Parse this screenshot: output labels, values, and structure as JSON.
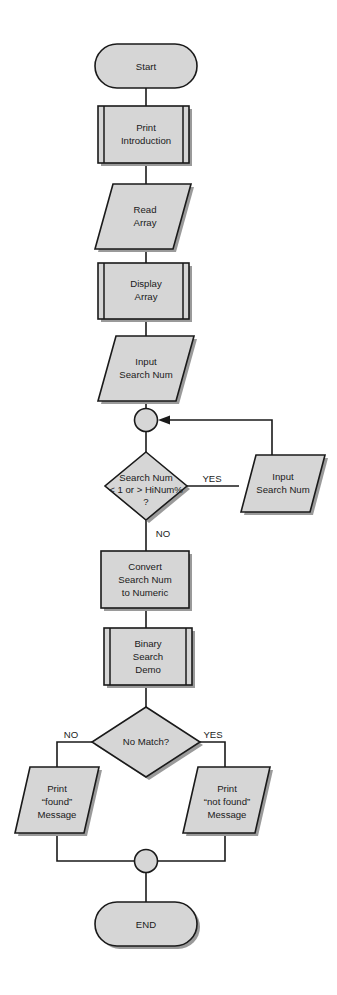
{
  "diagram": {
    "type": "flowchart",
    "background_color": "#ffffff",
    "node_fill_color": "#d6d6d6",
    "node_stroke_color": "#1a1a1a",
    "shadow_color": "#9a9a9a",
    "nodes": {
      "start": {
        "label": "Start",
        "shape": "terminator"
      },
      "print_intro": {
        "line1": "Print",
        "line2": "Introduction",
        "shape": "predefined-process"
      },
      "read_array": {
        "line1": "Read",
        "line2": "Array",
        "shape": "parallelogram"
      },
      "display_array": {
        "line1": "Display",
        "line2": "Array",
        "shape": "predefined-process"
      },
      "input_search_num": {
        "line1": "Input",
        "line2": "Search Num",
        "shape": "parallelogram"
      },
      "connector_top": {
        "label": "",
        "shape": "connector"
      },
      "validate_decision": {
        "line1": "Search Num",
        "line2": "< 1 or > HiNum%",
        "line3": "?",
        "shape": "decision"
      },
      "input_search_num_retry": {
        "line1": "Input",
        "line2": "Search Num",
        "shape": "parallelogram"
      },
      "convert": {
        "line1": "Convert",
        "line2": "Search Num",
        "line3": "to Numeric",
        "shape": "process"
      },
      "binary_search": {
        "line1": "Binary",
        "line2": "Search",
        "line3": "Demo",
        "shape": "predefined-process"
      },
      "no_match_decision": {
        "label": "No Match?",
        "shape": "decision"
      },
      "print_found": {
        "line1": "Print",
        "line2": "“found”",
        "line3": "Message",
        "shape": "parallelogram"
      },
      "print_not_found": {
        "line1": "Print",
        "line2": "“not found”",
        "line3": "Message",
        "shape": "parallelogram"
      },
      "connector_bottom": {
        "label": "",
        "shape": "connector"
      },
      "end": {
        "label": "END",
        "shape": "terminator"
      }
    },
    "branch_labels": {
      "validate_yes": "YES",
      "validate_no": "NO",
      "match_no": "NO",
      "match_yes": "YES"
    }
  }
}
